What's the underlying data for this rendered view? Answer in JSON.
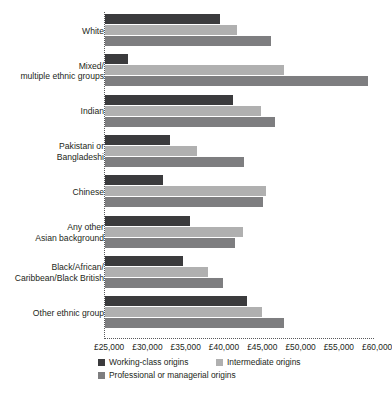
{
  "chart_data": {
    "type": "bar",
    "orientation": "horizontal",
    "title": "",
    "subtitle": "",
    "xlabel": "",
    "ylabel": "",
    "xlim": [
      25000,
      60000
    ],
    "grid": false,
    "legend_position": "bottom",
    "currency_prefix": "£",
    "tick_labels": [
      "£25,000",
      "£30,000",
      "£35,000",
      "£40,000",
      "£45,000",
      "£50,000",
      "£55,000",
      "£60,000"
    ],
    "tick_values": [
      25000,
      30000,
      35000,
      40000,
      45000,
      50000,
      55000,
      60000
    ],
    "categories": [
      "White",
      "Mixed/\nmultiple ethnic groups",
      "Indian",
      "Pakistani or\nBangladeshi",
      "Chinese",
      "Any other\nAsian background",
      "Black/African/\nCaribbean/Black British",
      "Other ethnic group"
    ],
    "series": [
      {
        "name": "Working-class origins",
        "color": "#3b3b3d",
        "values": [
          40000,
          28000,
          41700,
          33500,
          32600,
          36100,
          35200,
          43500
        ]
      },
      {
        "name": "Intermediate origins",
        "color": "#b0b0b0",
        "values": [
          42200,
          48400,
          45400,
          37000,
          46000,
          43000,
          38400,
          45500
        ]
      },
      {
        "name": "Professional or managerial origins",
        "color": "#7e7e80",
        "values": [
          46700,
          59300,
          47200,
          43200,
          45600,
          42000,
          40400,
          48400
        ]
      }
    ]
  },
  "legend": {
    "items": [
      {
        "label": "Working-class origins",
        "swatch": "#3b3b3d"
      },
      {
        "label": "Intermediate origins",
        "swatch": "#b0b0b0"
      },
      {
        "label": "Professional or managerial origins",
        "swatch": "#7e7e80"
      }
    ]
  }
}
